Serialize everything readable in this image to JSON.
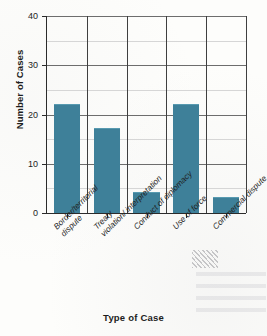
{
  "chart_data": {
    "type": "bar",
    "title": "",
    "xlabel": "Type of Case",
    "ylabel": "Number of Cases",
    "categories": [
      "Border/territorial dispute",
      "Treaty violation/ interpretation",
      "Conduct of diplomacy",
      "Use of force",
      "Commercial dispute"
    ],
    "category_lines": [
      [
        "Border/territorial",
        "dispute"
      ],
      [
        "Treaty",
        "violation/ interpretation"
      ],
      [
        "Conduct of diplomacy"
      ],
      [
        "Use of force"
      ],
      [
        "Commercial dispute"
      ]
    ],
    "values": [
      22,
      17,
      4,
      22,
      3
    ],
    "ylim": [
      0,
      40
    ],
    "ytick_labels": [
      "0",
      "10",
      "20",
      "30",
      "40"
    ],
    "ytick_values": [
      0,
      10,
      20,
      30,
      40
    ],
    "minor_tick_values": [
      5,
      15,
      25,
      35
    ],
    "grid": "horizontal-and-vertical",
    "legend": "none",
    "bar_color": "#3e8099",
    "major_gridline_color": "#6d6d6d",
    "minor_gridline_color": "#d6d6d6",
    "axis_color": "#2b2b2b"
  }
}
